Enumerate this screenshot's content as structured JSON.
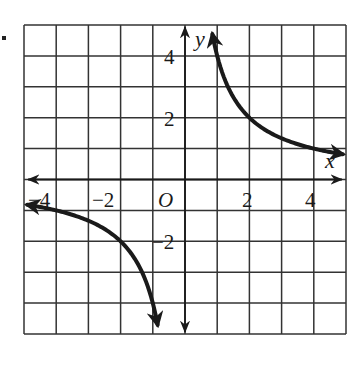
{
  "chart_data": {
    "type": "line",
    "title": "",
    "xlabel": "x",
    "ylabel": "y",
    "xlim": [
      -5,
      5
    ],
    "ylim": [
      -5,
      5
    ],
    "grid": true,
    "grid_step": 1,
    "origin_label": "O",
    "x_tick_labels": [
      {
        "value": -4,
        "label": "−4"
      },
      {
        "value": -2,
        "label": "−2"
      },
      {
        "value": 2,
        "label": "2"
      },
      {
        "value": 4,
        "label": "4"
      }
    ],
    "y_tick_labels": [
      {
        "value": 4,
        "label": "4"
      },
      {
        "value": 2,
        "label": "2"
      },
      {
        "value": -2,
        "label": "−2"
      }
    ],
    "series": [
      {
        "name": "y = 4/x (x > 0 branch)",
        "function": "4/x",
        "x_range": [
          0.85,
          4.9
        ],
        "points": [
          [
            0.85,
            4.7
          ],
          [
            1,
            4
          ],
          [
            1.5,
            2.67
          ],
          [
            2,
            2
          ],
          [
            3,
            1.33
          ],
          [
            4,
            1
          ],
          [
            4.9,
            0.82
          ]
        ],
        "arrows": "both"
      },
      {
        "name": "y = 4/x (x < 0 branch)",
        "function": "4/x",
        "x_range": [
          -4.9,
          -0.85
        ],
        "points": [
          [
            -4.9,
            -0.82
          ],
          [
            -4,
            -1
          ],
          [
            -3,
            -1.33
          ],
          [
            -2,
            -2
          ],
          [
            -1.5,
            -2.67
          ],
          [
            -1,
            -4
          ],
          [
            -0.85,
            -4.7
          ]
        ],
        "arrows": "both"
      }
    ],
    "colors": {
      "ink": "#1a1a1a",
      "grid": "#333333",
      "background": "#ffffff"
    }
  },
  "labels": {
    "x_axis": "x",
    "y_axis": "y",
    "origin": "O",
    "x_ticks": [
      "−4",
      "−2",
      "2",
      "4"
    ],
    "y_ticks": [
      "4",
      "2",
      "−2"
    ]
  }
}
